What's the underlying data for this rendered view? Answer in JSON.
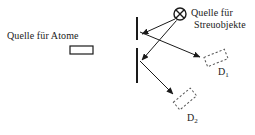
{
  "figure": {
    "kind": "physics-scattering-schematic",
    "background_color": "#ffffff",
    "ink_color": "#1a1a1a",
    "width": 255,
    "height": 135
  },
  "labels": {
    "atom_source": "Quelle für Atome",
    "scatter_source_line1": "Quelle für",
    "scatter_source_line2": "Streuobjekte",
    "detector_1": "D",
    "detector_1_sub": "1",
    "detector_2": "D",
    "detector_2_sub": "2"
  },
  "elements": {
    "atom_source_box": {
      "name": "atom-source-rectangle",
      "x": 70,
      "y": 46,
      "width": 23,
      "height": 8,
      "style": "solid-outline"
    },
    "scatter_source_symbol": {
      "name": "circled-x-symbol",
      "cx": 180,
      "cy": 14,
      "r": 6,
      "style": "circle-with-x"
    },
    "barrier": {
      "name": "double-slit-barrier",
      "x": 137,
      "segments": [
        {
          "y1": 17,
          "y2": 40
        },
        {
          "y1": 48,
          "y2": 83
        }
      ],
      "stroke_width": 2
    },
    "detector_1_box": {
      "name": "detector-1-dashed-box",
      "cx": 216,
      "cy": 58,
      "width": 22,
      "height": 10,
      "rotation_deg": -22,
      "style": "dashed-outline"
    },
    "detector_2_box": {
      "name": "detector-2-dashed-box",
      "cx": 185,
      "cy": 99,
      "width": 22,
      "height": 10,
      "rotation_deg": -40,
      "style": "dashed-outline"
    }
  },
  "arrows": [
    {
      "name": "arrow-source-to-upper-slit",
      "from": [
        175,
        19
      ],
      "to": [
        141,
        34
      ],
      "description": "from scatter source down-left to upper slit edge"
    },
    {
      "name": "arrow-source-to-lower-slit",
      "from": [
        176,
        20
      ],
      "to": [
        141,
        60
      ],
      "description": "from scatter source down-left to lower slit edge"
    },
    {
      "name": "arrow-upper-slit-to-detector-1",
      "from": [
        141,
        32
      ],
      "to": [
        200,
        57
      ],
      "description": "from upper slit region right-down to detector D1"
    },
    {
      "name": "arrow-lower-slit-to-detector-2",
      "from": [
        141,
        62
      ],
      "to": [
        174,
        95
      ],
      "description": "from lower slit region right-down to detector D2"
    }
  ]
}
